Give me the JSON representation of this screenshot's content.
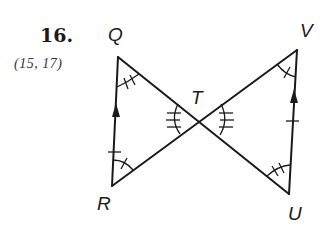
{
  "problem": {
    "number": "16.",
    "reference": "(15, 17)"
  },
  "diagram": {
    "type": "geometry-figure",
    "points": {
      "Q": {
        "label": "Q",
        "x": 118,
        "y": 57
      },
      "R": {
        "label": "R",
        "x": 112,
        "y": 186
      },
      "T": {
        "label": "T",
        "x": 199,
        "y": 120
      },
      "V": {
        "label": "V",
        "x": 297,
        "y": 50
      },
      "U": {
        "label": "U",
        "x": 289,
        "y": 194
      }
    },
    "segments": [
      "QU",
      "VR",
      "QR",
      "VU"
    ],
    "markings": {
      "QR": "single tick + arrow (parallel)",
      "VU": "single tick + arrow (parallel)",
      "angle_Q": "double tick arc",
      "angle_U": "double tick arc",
      "angle_R": "single tick arc",
      "angle_V": "single tick arc",
      "angle_QTR": "triple tick arc",
      "angle_VTU": "triple tick arc"
    },
    "color": "#1a1a1a"
  }
}
